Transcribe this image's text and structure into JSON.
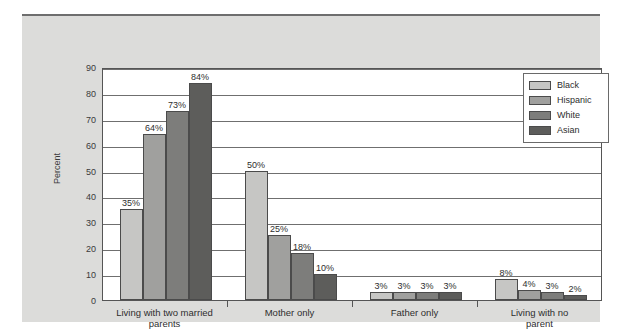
{
  "chart_data": {
    "type": "bar",
    "title": "",
    "xlabel": "",
    "ylabel": "Percent",
    "ylim": [
      0,
      90
    ],
    "ytick_step": 10,
    "yticks": [
      90,
      80,
      70,
      60,
      50,
      40,
      30,
      20,
      10,
      0
    ],
    "grid": true,
    "legend_position": "top-right inside plot",
    "categories": [
      "Living with two married parents",
      "Mother only",
      "Father only",
      "Living with no parent"
    ],
    "category_lines": [
      [
        "Living with two married",
        "parents"
      ],
      [
        "Mother only"
      ],
      [
        "Father only"
      ],
      [
        "Living with no parent"
      ]
    ],
    "series": [
      {
        "name": "Black",
        "color": "#c6c6c4",
        "values": [
          35,
          50,
          3,
          8
        ],
        "labels": [
          "35%",
          "50%",
          "3%",
          "8%"
        ]
      },
      {
        "name": "Hispanic",
        "color": "#a0a09e",
        "values": [
          64,
          25,
          3,
          4
        ],
        "labels": [
          "64%",
          "25%",
          "3%",
          "4%"
        ]
      },
      {
        "name": "White",
        "color": "#7d7d7b",
        "values": [
          73,
          18,
          3,
          3
        ],
        "labels": [
          "73%",
          "18%",
          "3%",
          "3%"
        ]
      },
      {
        "name": "Asian",
        "color": "#5d5d5b",
        "values": [
          84,
          10,
          3,
          2
        ],
        "labels": [
          "84%",
          "10%",
          "3%",
          "2%"
        ]
      }
    ]
  },
  "legend": {
    "items": [
      {
        "label": "Black",
        "color": "#c6c6c4"
      },
      {
        "label": "Hispanic",
        "color": "#a0a09e"
      },
      {
        "label": "White",
        "color": "#7d7d7b"
      },
      {
        "label": "Asian",
        "color": "#5d5d5b"
      }
    ]
  }
}
